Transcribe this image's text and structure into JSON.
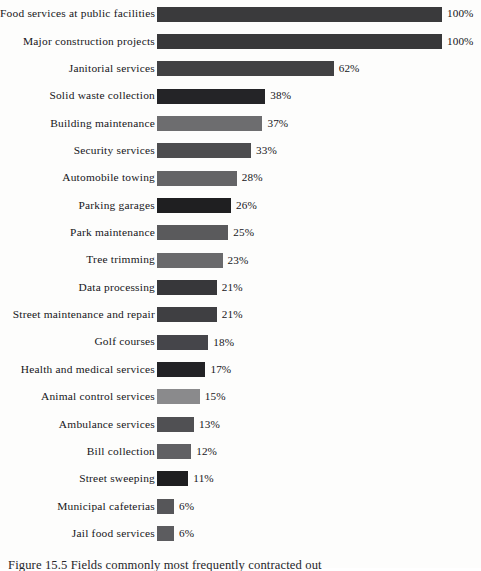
{
  "chart_data": {
    "type": "bar",
    "orientation": "horizontal",
    "title": "",
    "subtitle": "",
    "xlabel": "",
    "ylabel": "",
    "xlim": [
      0,
      100
    ],
    "grid": false,
    "legend": false,
    "value_suffix": "%",
    "categories": [
      "Food services at public facilities",
      "Major construction projects",
      "Janitorial services",
      "Solid waste collection",
      "Building maintenance",
      "Security services",
      "Automobile towing",
      "Parking garages",
      "Park maintenance",
      "Tree trimming",
      "Data processing",
      "Street maintenance and repair",
      "Golf courses",
      "Health and medical services",
      "Animal control services",
      "Ambulance services",
      "Bill collection",
      "Street sweeping",
      "Municipal cafeterias",
      "Jail food services"
    ],
    "values": [
      100,
      100,
      62,
      38,
      37,
      33,
      28,
      26,
      25,
      23,
      21,
      21,
      18,
      17,
      15,
      13,
      12,
      11,
      6,
      6
    ],
    "value_labels": [
      "100%",
      "100%",
      "62%",
      "38%",
      "37%",
      "33%",
      "28%",
      "26%",
      "25%",
      "23%",
      "21%",
      "21%",
      "18%",
      "17%",
      "15%",
      "13%",
      "12%",
      "11%",
      "6%",
      "6%"
    ],
    "bar_colors": [
      "#3a3a3c",
      "#38383a",
      "#414143",
      "#242427",
      "#6d6d6f",
      "#4d4d4f",
      "#646466",
      "#1f1f21",
      "#5a5a5c",
      "#6a6a6c",
      "#37373a",
      "#3f3f42",
      "#45454a",
      "#222225",
      "#8a8a8c",
      "#505053",
      "#606063",
      "#1e1e20",
      "#565659",
      "#5c5c5f"
    ]
  },
  "figure": {
    "caption": "Figure 15.5 Fields commonly most frequently contracted out"
  }
}
